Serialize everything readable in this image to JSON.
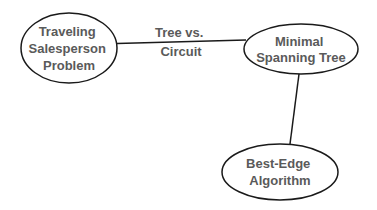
{
  "diagram": {
    "type": "concept-map",
    "nodes": [
      {
        "id": "tsp",
        "lines": [
          "Traveling",
          "Salesperson",
          "Problem"
        ]
      },
      {
        "id": "mst",
        "lines": [
          "Minimal",
          "Spanning Tree"
        ]
      },
      {
        "id": "bea",
        "lines": [
          "Best-Edge",
          "Algorithm"
        ]
      }
    ],
    "edges": [
      {
        "from": "tsp",
        "to": "mst",
        "label_lines": [
          "Tree vs.",
          "Circuit"
        ]
      },
      {
        "from": "mst",
        "to": "bea",
        "label_lines": []
      }
    ],
    "colors": {
      "stroke": "#1a1a1a",
      "text": "#5a5a5a",
      "background": "#ffffff"
    }
  }
}
